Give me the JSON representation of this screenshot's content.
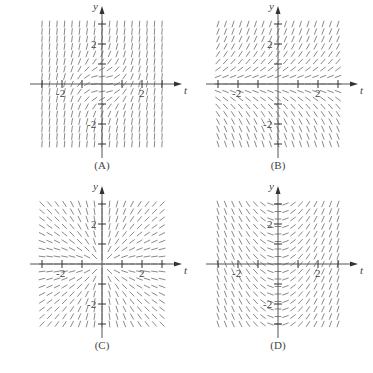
{
  "figure": {
    "panels": [
      {
        "id": "A",
        "caption": "(A)",
        "equation_hint": "slope = t^2 + y^2",
        "x_axis_label": "t",
        "y_axis_label": "y",
        "tick_labels": {
          "t": [
            "-2",
            "2"
          ],
          "y": [
            "2",
            "-2"
          ]
        }
      },
      {
        "id": "B",
        "caption": "(B)",
        "equation_hint": "slope = y",
        "x_axis_label": "t",
        "y_axis_label": "y",
        "tick_labels": {
          "t": [
            "-2",
            "2"
          ],
          "y": [
            "2",
            "-2"
          ]
        }
      },
      {
        "id": "C",
        "caption": "(C)",
        "equation_hint": "slope = y / t",
        "x_axis_label": "t",
        "y_axis_label": "y",
        "tick_labels": {
          "t": [
            "-2",
            "2"
          ],
          "y": [
            "2",
            "-2"
          ]
        }
      },
      {
        "id": "D",
        "caption": "(D)",
        "equation_hint": "slope = t",
        "x_axis_label": "t",
        "y_axis_label": "y",
        "tick_labels": {
          "t": [
            "-2",
            "2"
          ],
          "y": [
            "2",
            "-2"
          ]
        }
      }
    ],
    "colors": {
      "segments": "#8a8a8a",
      "axes": "#555555",
      "text": "#444444"
    }
  },
  "chart_data": [
    {
      "type": "slope_field",
      "title": "(A)",
      "xlabel": "t",
      "ylabel": "y",
      "xlim": [
        -3,
        3
      ],
      "ylim": [
        -3,
        3
      ],
      "slope_function": "t^2 + y^2",
      "x_ticks": [
        -3,
        -2,
        -1,
        1,
        2,
        3
      ],
      "y_ticks": [
        -3,
        -2,
        -1,
        1,
        2,
        3
      ],
      "labeled_ticks": {
        "t": [
          -2,
          2
        ],
        "y": [
          -2,
          2
        ]
      }
    },
    {
      "type": "slope_field",
      "title": "(B)",
      "xlabel": "t",
      "ylabel": "y",
      "xlim": [
        -3,
        3
      ],
      "ylim": [
        -3,
        3
      ],
      "slope_function": "y",
      "x_ticks": [
        -3,
        -2,
        -1,
        1,
        2,
        3
      ],
      "y_ticks": [
        -3,
        -2,
        -1,
        1,
        2,
        3
      ],
      "labeled_ticks": {
        "t": [
          -2,
          2
        ],
        "y": [
          -2,
          2
        ]
      }
    },
    {
      "type": "slope_field",
      "title": "(C)",
      "xlabel": "t",
      "ylabel": "y",
      "xlim": [
        -3,
        3
      ],
      "ylim": [
        -3,
        3
      ],
      "slope_function": "y / t",
      "x_ticks": [
        -3,
        -2,
        -1,
        1,
        2,
        3
      ],
      "y_ticks": [
        -3,
        -2,
        -1,
        1,
        2,
        3
      ],
      "labeled_ticks": {
        "t": [
          -2,
          2
        ],
        "y": [
          -2,
          2
        ]
      }
    },
    {
      "type": "slope_field",
      "title": "(D)",
      "xlabel": "t",
      "ylabel": "y",
      "xlim": [
        -3,
        3
      ],
      "ylim": [
        -3,
        3
      ],
      "slope_function": "t",
      "x_ticks": [
        -3,
        -2,
        -1,
        1,
        2,
        3
      ],
      "y_ticks": [
        -3,
        -2,
        -1,
        1,
        2,
        3
      ],
      "labeled_ticks": {
        "t": [
          -2,
          2
        ],
        "y": [
          -2,
          2
        ]
      }
    }
  ]
}
